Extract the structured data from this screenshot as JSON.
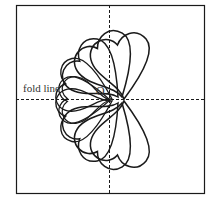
{
  "diagram": {
    "labels": {
      "fold_line": "fold line",
      "origin": "O"
    },
    "colors": {
      "stroke": "#1a1a1a",
      "background": "#ffffff"
    },
    "shape": "heart",
    "heart_count": 10
  }
}
